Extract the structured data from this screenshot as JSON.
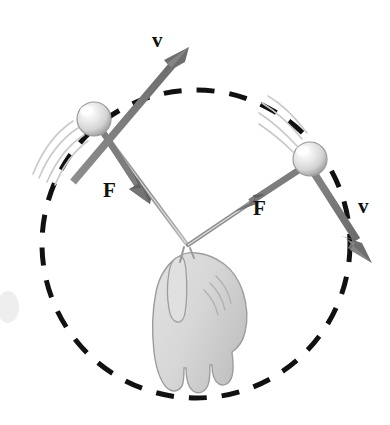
{
  "figure": {
    "width": 390,
    "height": 425
  },
  "colors": {
    "background": "#ffffff",
    "dashed_circle": "#111111",
    "vector_arrow": "#7a7a7a",
    "vector_arrow_dark": "#6d6d6d",
    "string": "#9a9a9a",
    "ball_light": "#f2f2f2",
    "ball_mid": "#d0d0d0",
    "ball_shadow": "#9e9e9e",
    "ball_outline": "#8c8c8c",
    "motion_line": "#c9c9c9",
    "hand_fill": "#d9d9d9",
    "hand_outline": "#9a9a9a",
    "label_text": "#111111",
    "smudge": "#ececec"
  },
  "labels": {
    "velocity_top": "v",
    "velocity_right": "v",
    "force_left": "F",
    "force_right": "F"
  },
  "geometry": {
    "circle": {
      "center_x": 196,
      "center_y": 244,
      "radius": 154,
      "dash": "18 15",
      "stroke_width": 5
    },
    "ball_left": {
      "cx": 94,
      "cy": 119,
      "r": 17
    },
    "ball_right": {
      "cx": 310,
      "cy": 159,
      "r": 17
    },
    "hand_grip": {
      "x": 184,
      "y": 243
    },
    "velocity_top_vector": {
      "from_x": 78,
      "from_y": 180,
      "to_x": 184,
      "to_y": 52
    },
    "velocity_right_vector": {
      "from_x": 300,
      "from_y": 145,
      "to_x": 370,
      "to_y": 254
    },
    "force_left_vector": {
      "from_x": 101,
      "from_y": 130,
      "to_x": 147,
      "to_y": 199
    },
    "force_right_vector": {
      "from_x": 303,
      "from_y": 170,
      "to_x": 241,
      "to_y": 209
    }
  }
}
